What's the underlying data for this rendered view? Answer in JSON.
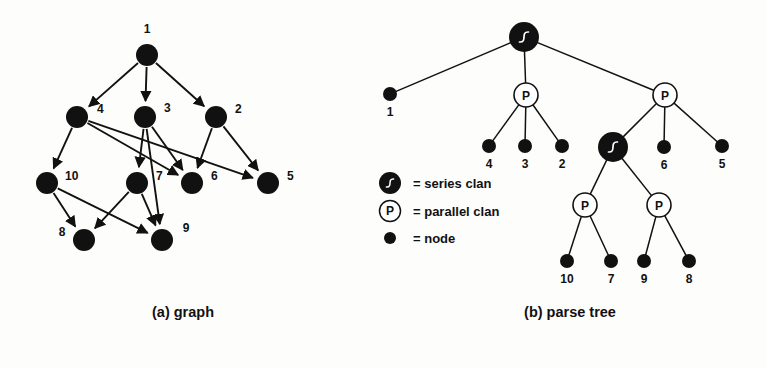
{
  "figure": {
    "captions": {
      "left": "(a) graph",
      "right": "(b) parse tree"
    },
    "legend": {
      "items": [
        {
          "icon": "series-clan-icon",
          "symbol": "S",
          "text": "= series clan"
        },
        {
          "icon": "parallel-clan-icon",
          "symbol": "P",
          "text": "= parallel clan"
        },
        {
          "icon": "node-dot-icon",
          "symbol": "",
          "text": "= node"
        }
      ]
    },
    "graph": {
      "title": "(a) graph",
      "nodes": [
        {
          "id": "1",
          "label": "1",
          "x": 147,
          "y": 55,
          "r": 11,
          "lx": 147,
          "ly": 33,
          "anchor": "middle"
        },
        {
          "id": "4",
          "label": "4",
          "x": 77,
          "y": 117,
          "r": 11,
          "lx": 97,
          "ly": 113,
          "anchor": "start"
        },
        {
          "id": "3",
          "label": "3",
          "x": 145,
          "y": 117,
          "r": 11,
          "lx": 164,
          "ly": 112,
          "anchor": "start"
        },
        {
          "id": "2",
          "label": "2",
          "x": 216,
          "y": 117,
          "r": 11,
          "lx": 235,
          "ly": 113,
          "anchor": "start"
        },
        {
          "id": "10",
          "label": "10",
          "x": 47,
          "y": 183,
          "r": 11,
          "lx": 65,
          "ly": 180,
          "anchor": "start"
        },
        {
          "id": "7",
          "label": "7",
          "x": 137,
          "y": 183,
          "r": 11,
          "lx": 156,
          "ly": 180,
          "anchor": "start"
        },
        {
          "id": "6",
          "label": "6",
          "x": 192,
          "y": 183,
          "r": 11,
          "lx": 211,
          "ly": 180,
          "anchor": "start"
        },
        {
          "id": "5",
          "label": "5",
          "x": 268,
          "y": 183,
          "r": 11,
          "lx": 287,
          "ly": 180,
          "anchor": "start"
        },
        {
          "id": "8",
          "label": "8",
          "x": 84,
          "y": 240,
          "r": 11,
          "lx": 62,
          "ly": 236,
          "anchor": "middle"
        },
        {
          "id": "9",
          "label": "9",
          "x": 162,
          "y": 240,
          "r": 11,
          "lx": 186,
          "ly": 232,
          "anchor": "middle"
        }
      ],
      "edges": [
        {
          "from": "1",
          "to": "4"
        },
        {
          "from": "1",
          "to": "3"
        },
        {
          "from": "1",
          "to": "2"
        },
        {
          "from": "4",
          "to": "10"
        },
        {
          "from": "4",
          "to": "6"
        },
        {
          "from": "4",
          "to": "5"
        },
        {
          "from": "3",
          "to": "7"
        },
        {
          "from": "3",
          "to": "6"
        },
        {
          "from": "3",
          "to": "9"
        },
        {
          "from": "2",
          "to": "6"
        },
        {
          "from": "2",
          "to": "5"
        },
        {
          "from": "10",
          "to": "8"
        },
        {
          "from": "10",
          "to": "9"
        },
        {
          "from": "7",
          "to": "8"
        },
        {
          "from": "7",
          "to": "9"
        }
      ]
    },
    "parse_tree": {
      "title": "(b) parse tree",
      "nodes": [
        {
          "id": "S0",
          "type": "series",
          "label": "S",
          "x": 524,
          "y": 37,
          "r": 15,
          "text": ""
        },
        {
          "id": "L1",
          "type": "leaf",
          "label": "1",
          "x": 390,
          "y": 94,
          "r": 7,
          "lx": 390,
          "ly": 116
        },
        {
          "id": "P1",
          "type": "parallel",
          "label": "P",
          "x": 526,
          "y": 95,
          "r": 12,
          "text": ""
        },
        {
          "id": "P2",
          "type": "parallel",
          "label": "P",
          "x": 665,
          "y": 95,
          "r": 12,
          "text": ""
        },
        {
          "id": "L4",
          "type": "leaf",
          "label": "4",
          "x": 489,
          "y": 146,
          "r": 7,
          "lx": 489,
          "ly": 168
        },
        {
          "id": "L3",
          "type": "leaf",
          "label": "3",
          "x": 525,
          "y": 146,
          "r": 7,
          "lx": 525,
          "ly": 168
        },
        {
          "id": "L2",
          "type": "leaf",
          "label": "2",
          "x": 562,
          "y": 146,
          "r": 7,
          "lx": 562,
          "ly": 168
        },
        {
          "id": "S1",
          "type": "series",
          "label": "S",
          "x": 613,
          "y": 147,
          "r": 15,
          "text": ""
        },
        {
          "id": "L6",
          "type": "leaf",
          "label": "6",
          "x": 664,
          "y": 147,
          "r": 7,
          "lx": 664,
          "ly": 169
        },
        {
          "id": "L5",
          "type": "leaf",
          "label": "5",
          "x": 722,
          "y": 146,
          "r": 7,
          "lx": 722,
          "ly": 168
        },
        {
          "id": "P3",
          "type": "parallel",
          "label": "P",
          "x": 585,
          "y": 205,
          "r": 12,
          "text": ""
        },
        {
          "id": "P4",
          "type": "parallel",
          "label": "P",
          "x": 659,
          "y": 205,
          "r": 12,
          "text": ""
        },
        {
          "id": "L10",
          "type": "leaf",
          "label": "10",
          "x": 567,
          "y": 261,
          "r": 7,
          "lx": 567,
          "ly": 283
        },
        {
          "id": "L7",
          "type": "leaf",
          "label": "7",
          "x": 611,
          "y": 261,
          "r": 7,
          "lx": 611,
          "ly": 283
        },
        {
          "id": "L9",
          "type": "leaf",
          "label": "9",
          "x": 644,
          "y": 261,
          "r": 7,
          "lx": 644,
          "ly": 283
        },
        {
          "id": "L8",
          "type": "leaf",
          "label": "8",
          "x": 689,
          "y": 261,
          "r": 7,
          "lx": 689,
          "ly": 283
        }
      ],
      "edges": [
        {
          "from": "S0",
          "to": "L1"
        },
        {
          "from": "S0",
          "to": "P1"
        },
        {
          "from": "S0",
          "to": "P2"
        },
        {
          "from": "P1",
          "to": "L4"
        },
        {
          "from": "P1",
          "to": "L3"
        },
        {
          "from": "P1",
          "to": "L2"
        },
        {
          "from": "P2",
          "to": "S1"
        },
        {
          "from": "P2",
          "to": "L6"
        },
        {
          "from": "P2",
          "to": "L5"
        },
        {
          "from": "S1",
          "to": "P3"
        },
        {
          "from": "S1",
          "to": "P4"
        },
        {
          "from": "P3",
          "to": "L10"
        },
        {
          "from": "P3",
          "to": "L7"
        },
        {
          "from": "P4",
          "to": "L9"
        },
        {
          "from": "P4",
          "to": "L8"
        }
      ]
    },
    "colors": {
      "ink": "#111111",
      "paper": "#fdfdfb",
      "clan_fill": "#111111",
      "parallel_fill": "#ffffff"
    }
  }
}
